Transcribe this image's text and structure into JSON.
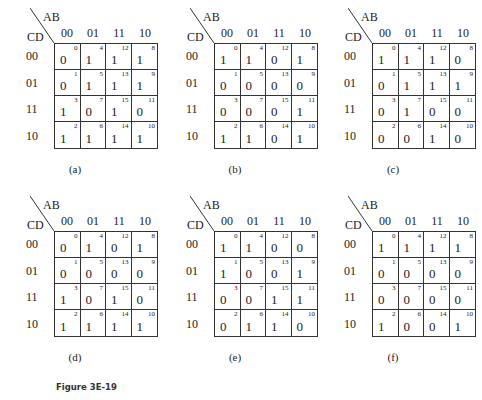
{
  "figure": {
    "caption": "Figure 3E-19"
  },
  "axes": {
    "col_var": "AB",
    "row_var": "CD",
    "col_codes": [
      "00",
      "01",
      "11",
      "10"
    ],
    "row_codes": [
      "00",
      "01",
      "11",
      "10"
    ],
    "cell_indices": [
      [
        "0",
        "4",
        "12",
        "8"
      ],
      [
        "1",
        "5",
        "13",
        "9"
      ],
      [
        "3",
        "7",
        "15",
        "11"
      ],
      [
        "2",
        "6",
        "14",
        "10"
      ]
    ]
  },
  "maps": [
    {
      "label": "(a)",
      "values": [
        [
          "0",
          "1",
          "1",
          "1"
        ],
        [
          "0",
          "1",
          "1",
          "1"
        ],
        [
          "1",
          "0",
          "1",
          "0"
        ],
        [
          "1",
          "1",
          "1",
          "1"
        ]
      ]
    },
    {
      "label": "(b)",
      "values": [
        [
          "1",
          "1",
          "0",
          "1"
        ],
        [
          "0",
          "0",
          "0",
          "0"
        ],
        [
          "0",
          "0",
          "0",
          "1"
        ],
        [
          "1",
          "1",
          "0",
          "1"
        ]
      ]
    },
    {
      "label": "(c)",
      "values": [
        [
          "1",
          "1",
          "1",
          "0"
        ],
        [
          "0",
          "1",
          "1",
          "1"
        ],
        [
          "0",
          "1",
          "0",
          "0"
        ],
        [
          "0",
          "0",
          "1",
          "0"
        ]
      ]
    },
    {
      "label": "(d)",
      "values": [
        [
          "0",
          "1",
          "0",
          "1"
        ],
        [
          "0",
          "0",
          "0",
          "0"
        ],
        [
          "1",
          "0",
          "1",
          "0"
        ],
        [
          "1",
          "1",
          "1",
          "1"
        ]
      ]
    },
    {
      "label": "(e)",
      "values": [
        [
          "1",
          "1",
          "0",
          "0"
        ],
        [
          "1",
          "0",
          "0",
          "1"
        ],
        [
          "0",
          "0",
          "1",
          "1"
        ],
        [
          "0",
          "1",
          "1",
          "0"
        ]
      ]
    },
    {
      "label": "(f)",
      "values": [
        [
          "1",
          "1",
          "1",
          "1"
        ],
        [
          "0",
          "0",
          "0",
          "0"
        ],
        [
          "0",
          "0",
          "0",
          "0"
        ],
        [
          "1",
          "0",
          "0",
          "1"
        ]
      ]
    }
  ]
}
